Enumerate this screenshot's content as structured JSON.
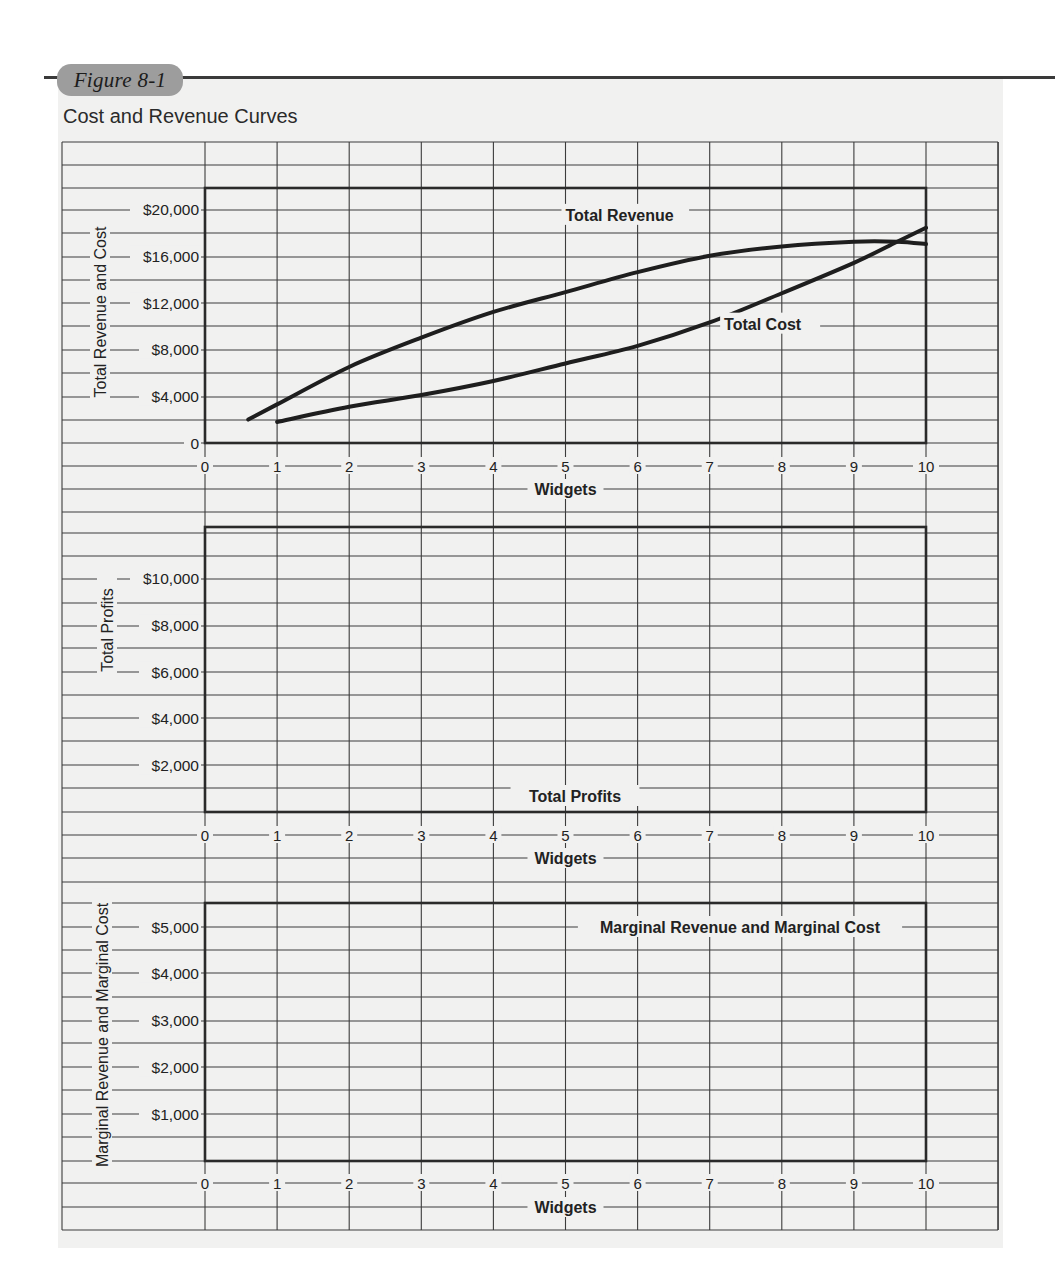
{
  "figure": {
    "label": "Figure 8-1",
    "title": "Cost and Revenue Curves",
    "accent_pill_color": "#9d9d9d",
    "grid_color": "#3c3c3c",
    "curve_color": "#1e1e1e"
  },
  "chart_data": [
    {
      "type": "line",
      "title": "Total Revenue and Total Cost",
      "xlabel": "Widgets",
      "ylabel": "Total Revenue and Cost",
      "x_ticks": [
        "0",
        "1",
        "2",
        "3",
        "4",
        "5",
        "6",
        "7",
        "8",
        "9",
        "10"
      ],
      "y_ticks": [
        {
          "value": 0,
          "label": "0"
        },
        {
          "value": 4000,
          "label": "$4,000"
        },
        {
          "value": 8000,
          "label": "$8,000"
        },
        {
          "value": 12000,
          "label": "$12,000"
        },
        {
          "value": 16000,
          "label": "$16,000"
        },
        {
          "value": 20000,
          "label": "$20,000"
        }
      ],
      "xlim": [
        0,
        10
      ],
      "ylim": [
        0,
        22000
      ],
      "grid": true,
      "series": [
        {
          "name": "Total Revenue",
          "x": [
            0.6,
            1,
            2,
            3,
            4,
            5,
            6,
            7,
            8,
            9,
            9.6,
            10
          ],
          "values": [
            2000,
            3300,
            6500,
            9000,
            11200,
            12900,
            14600,
            16000,
            16800,
            17200,
            17200,
            17000
          ],
          "label_pos": {
            "x": 5.0,
            "y": 19500
          }
        },
        {
          "name": "Total Cost",
          "x": [
            1,
            2,
            3,
            4,
            5,
            6,
            7,
            8,
            9,
            9.6,
            10
          ],
          "values": [
            1800,
            3100,
            4100,
            5300,
            6800,
            8300,
            10300,
            12800,
            15400,
            17200,
            18400
          ],
          "label_pos": {
            "x": 7.2,
            "y": 10200
          }
        }
      ]
    },
    {
      "type": "line",
      "title": "Total Profits",
      "xlabel": "Widgets",
      "ylabel": "Total Profits",
      "x_ticks": [
        "0",
        "1",
        "2",
        "3",
        "4",
        "5",
        "6",
        "7",
        "8",
        "9",
        "10"
      ],
      "y_ticks": [
        {
          "value": 2000,
          "label": "$2,000"
        },
        {
          "value": 4000,
          "label": "$4,000"
        },
        {
          "value": 6000,
          "label": "$6,000"
        },
        {
          "value": 8000,
          "label": "$8,000"
        },
        {
          "value": 10000,
          "label": "$10,000"
        }
      ],
      "xlim": [
        0,
        10
      ],
      "ylim": [
        0,
        12250
      ],
      "grid": true,
      "series": [],
      "annotation": "Total Profits"
    },
    {
      "type": "line",
      "title": "Marginal Revenue and Marginal Cost",
      "xlabel": "Widgets",
      "ylabel": "Marginal Revenue and Marginal Cost",
      "x_ticks": [
        "0",
        "1",
        "2",
        "3",
        "4",
        "5",
        "6",
        "7",
        "8",
        "9",
        "10"
      ],
      "y_ticks": [
        {
          "value": 1000,
          "label": "$1,000"
        },
        {
          "value": 2000,
          "label": "$2,000"
        },
        {
          "value": 3000,
          "label": "$3,000"
        },
        {
          "value": 4000,
          "label": "$4,000"
        },
        {
          "value": 5000,
          "label": "$5,000"
        }
      ],
      "xlim": [
        0,
        10
      ],
      "ylim": [
        0,
        5500
      ],
      "grid": true,
      "series": [],
      "annotation": "Marginal Revenue and Marginal Cost"
    }
  ]
}
